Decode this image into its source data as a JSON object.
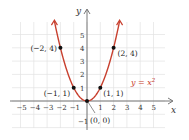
{
  "chart_data": {
    "type": "line",
    "title": "",
    "xlabel": "x",
    "ylabel": "y",
    "xlim": [
      -6,
      6
    ],
    "ylim": [
      -2,
      6
    ],
    "grid": true,
    "x_ticks": [
      "−5",
      "−4",
      "−3",
      "−2",
      "−1",
      "1",
      "2",
      "3",
      "4",
      "5"
    ],
    "y_ticks": [
      "−1",
      "1",
      "2",
      "3",
      "4",
      "5"
    ],
    "series": [
      {
        "name": "y = x²",
        "function": "y = x^2",
        "color": "#c8402f"
      }
    ],
    "points": [
      {
        "x": -2,
        "y": 4,
        "label": "(−2, 4)"
      },
      {
        "x": -1,
        "y": 1,
        "label": "(−1, 1)"
      },
      {
        "x": 0,
        "y": 0,
        "label": "(0, 0)"
      },
      {
        "x": 1,
        "y": 1,
        "label": "(1, 1)"
      },
      {
        "x": 2,
        "y": 4,
        "label": "(2, 4)"
      }
    ],
    "annotation": "y = x²"
  },
  "labels": {
    "x_axis": "x",
    "y_axis": "y",
    "equation_y": "y = x",
    "equation_exp": "2"
  }
}
